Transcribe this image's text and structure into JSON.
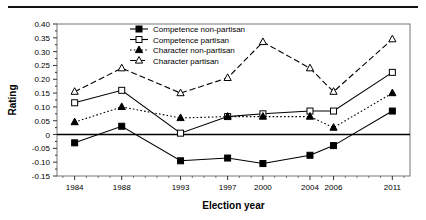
{
  "figure": {
    "top_rule": "horizontal-rule"
  },
  "chart_data": {
    "type": "line",
    "title": "",
    "xlabel": "Election year",
    "ylabel": "Rating",
    "categories": [
      "1984",
      "1988",
      "1993",
      "1997",
      "2000",
      "2004",
      "2006",
      "2011"
    ],
    "x": [
      1984,
      1988,
      1993,
      1997,
      2000,
      2004,
      2006,
      2011
    ],
    "xlim": [
      1982.5,
      2012.5
    ],
    "ylim": [
      -0.15,
      0.4
    ],
    "yticks": [
      -0.15,
      -0.1,
      -0.05,
      0,
      0.05,
      0.1,
      0.15,
      0.2,
      0.25,
      0.3,
      0.35,
      0.4
    ],
    "ytick_labels": [
      "-0.15",
      "-0.10",
      "-0.05",
      "0",
      "0.05",
      "0.10",
      "0.15",
      "0.20",
      "0.25",
      "0.30",
      "0.35",
      "0.40"
    ],
    "grid": false,
    "legend_position": "top-center",
    "zero_line": true,
    "series": [
      {
        "name": "Competence non-partisan",
        "marker": "filled-square",
        "line": "solid",
        "color": "#000000",
        "values": [
          -0.03,
          0.03,
          -0.095,
          -0.085,
          -0.105,
          -0.075,
          -0.04,
          0.085
        ]
      },
      {
        "name": "Competence partisan",
        "marker": "open-square",
        "line": "solid",
        "color": "#000000",
        "values": [
          0.115,
          0.16,
          0.005,
          0.065,
          0.075,
          0.085,
          0.085,
          0.225
        ]
      },
      {
        "name": "Character non-partisan",
        "marker": "filled-triangle",
        "line": "dotted",
        "color": "#000000",
        "values": [
          0.045,
          0.1,
          0.06,
          0.065,
          0.065,
          0.065,
          0.025,
          0.15
        ]
      },
      {
        "name": "Character partisan",
        "marker": "open-triangle",
        "line": "dashed",
        "color": "#000000",
        "values": [
          0.155,
          0.24,
          0.15,
          0.205,
          0.335,
          0.24,
          0.155,
          0.345
        ]
      }
    ]
  }
}
